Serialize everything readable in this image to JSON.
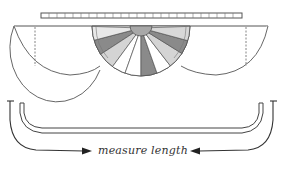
{
  "diagram": {
    "title": "",
    "caption": "measure length",
    "colors": {
      "stroke": "#555555",
      "dark_wedge": "#8a8a8a",
      "light_wedge": "#d4d4d4",
      "white_wedge": "#ffffff",
      "hub": "#a8a8a8"
    },
    "parts": [
      {
        "name": "ruler",
        "description": "segmented ruler bar at top"
      },
      {
        "name": "left-half-circle",
        "description": "plain half-circle panel with dashed line"
      },
      {
        "name": "center-fan",
        "description": "half-circle panel with alternating shaded wedges and hub"
      },
      {
        "name": "right-half-circle",
        "description": "plain half-circle panel with dashed line"
      },
      {
        "name": "bracket-shape",
        "description": "U-shaped double-outline form"
      },
      {
        "name": "left-arrow",
        "description": "curved arrow from left end pointing right"
      },
      {
        "name": "right-arrow",
        "description": "curved arrow from right end pointing left"
      }
    ]
  }
}
